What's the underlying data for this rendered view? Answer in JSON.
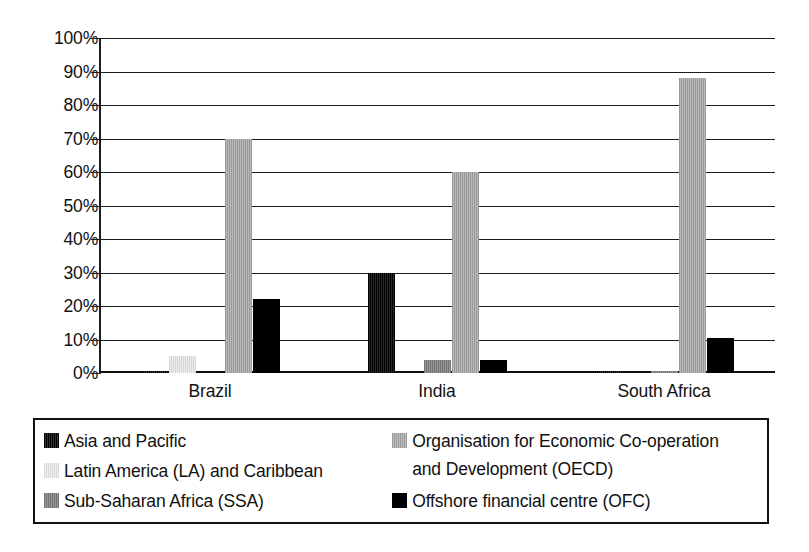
{
  "chart_data": {
    "type": "bar",
    "title": "",
    "subtitle": "",
    "xlabel": "",
    "ylabel": "",
    "ylim": [
      0,
      100
    ],
    "y_tick_labels": [
      "100%",
      "90%",
      "80%",
      "70%",
      "60%",
      "50%",
      "40%",
      "30%",
      "20%",
      "10%",
      "0%"
    ],
    "y_tick_values": [
      100,
      90,
      80,
      70,
      60,
      50,
      40,
      30,
      20,
      10,
      0
    ],
    "grid": true,
    "legend_position": "bottom",
    "categories": [
      "Brazil",
      "India",
      "South Africa"
    ],
    "series": [
      {
        "name": "Asia and Pacific",
        "color": "#1a1a1a",
        "values": [
          0.5,
          30,
          0.5
        ]
      },
      {
        "name": "Latin America (LA) and Caribbean",
        "color": "#e2e2e2",
        "values": [
          5,
          0,
          0
        ]
      },
      {
        "name": "Sub-Saharan Africa (SSA)",
        "color": "#848484",
        "values": [
          0,
          4,
          0.5
        ]
      },
      {
        "name": "Organisation for Economic Co-operation and Development (OECD)",
        "color": "#a9a9a9",
        "values": [
          70,
          60,
          88
        ]
      },
      {
        "name": "Offshore financial centre (OFC)",
        "color": "#000000",
        "values": [
          22,
          4,
          10.5
        ]
      }
    ]
  },
  "axis": {
    "ticks": [
      {
        "label": "100%"
      },
      {
        "label": "90%"
      },
      {
        "label": "80%"
      },
      {
        "label": "70%"
      },
      {
        "label": "60%"
      },
      {
        "label": "50%"
      },
      {
        "label": "40%"
      },
      {
        "label": "30%"
      },
      {
        "label": "20%"
      },
      {
        "label": "10%"
      },
      {
        "label": "0%"
      }
    ],
    "categories": [
      {
        "label": "Brazil"
      },
      {
        "label": "India"
      },
      {
        "label": "South Africa"
      }
    ]
  },
  "legend": {
    "items": [
      {
        "label": "Asia and Pacific",
        "swatch": "asia"
      },
      {
        "label": "Latin America (LA) and Caribbean",
        "swatch": "latam"
      },
      {
        "label": "Sub-Saharan Africa (SSA)",
        "swatch": "ssa"
      },
      {
        "label": "Organisation for Economic Co-operation\nand Development (OECD)",
        "swatch": "oecd"
      },
      {
        "label": "Offshore financial centre (OFC)",
        "swatch": "ofc"
      }
    ]
  }
}
